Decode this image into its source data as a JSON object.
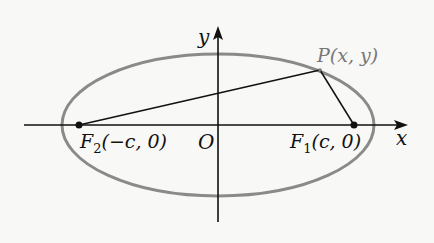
{
  "diagram": {
    "type": "ellipse-foci",
    "colors": {
      "background": "#f8f8f6",
      "ellipse": "#8a8a8a",
      "axes": "#111111",
      "segments": "#111111",
      "point_label": "#777777"
    },
    "geometry": {
      "center": [
        218,
        125
      ],
      "rx": 156,
      "ry": 71,
      "x_axis": {
        "y": 125,
        "x_start": 24,
        "x_end": 407
      },
      "y_axis": {
        "x": 218,
        "y_start": 222,
        "y_end": 27
      },
      "F2": [
        79,
        125
      ],
      "F1": [
        354,
        125
      ],
      "P": [
        320,
        70
      ]
    },
    "labels": {
      "y_axis": "y",
      "x_axis": "x",
      "origin": "O",
      "point_P": {
        "name": "P",
        "coords": "(x, y)"
      },
      "focus_F2": {
        "name": "F",
        "sub": "2",
        "coords": "(−c, 0)"
      },
      "focus_F1": {
        "name": "F",
        "sub": "1",
        "coords": "(c, 0)"
      }
    }
  }
}
